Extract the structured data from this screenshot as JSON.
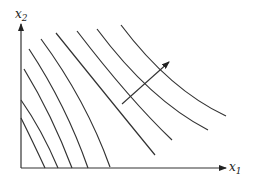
{
  "diagram": {
    "type": "indifference-curve-map",
    "axes": {
      "x_label": "x",
      "x_subscript": "1",
      "y_label": "x",
      "y_subscript": "2"
    },
    "curve_count": 9,
    "direction_arrow": "increasing-preference",
    "colors": {
      "line": "#333333",
      "background": "#ffffff"
    }
  }
}
